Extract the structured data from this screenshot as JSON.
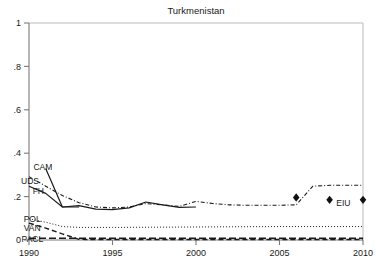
{
  "chart_data": {
    "type": "line",
    "title": "Turkmenistan",
    "xlabel": "",
    "ylabel": "",
    "xlim": [
      1990,
      2010
    ],
    "ylim": [
      0,
      1
    ],
    "grid": false,
    "legend_position": "inline-left",
    "xticks": [
      "1990",
      "1995",
      "2000",
      "2005",
      "2010"
    ],
    "xtick_values": [
      1990,
      1995,
      2000,
      2005,
      2010
    ],
    "yticks": [
      "0",
      ".2",
      ".4",
      ".6",
      ".8",
      "1"
    ],
    "ytick_values": [
      0,
      0.2,
      0.4,
      0.6,
      0.8,
      1
    ],
    "series": [
      {
        "name": "CAM",
        "label": "CAM",
        "style": "solid",
        "label_x": 1991.4,
        "label_y": 0.335,
        "x": [
          1991,
          1992,
          1993
        ],
        "values": [
          0.33,
          0.152,
          0.152
        ]
      },
      {
        "name": "UDS",
        "label": "UDS",
        "style": "dash-dot",
        "label_x": 1990.6,
        "label_y": 0.272,
        "x": [
          1990,
          1991,
          1992,
          1993,
          1994,
          1995,
          1996,
          1997,
          1998,
          1999,
          2000,
          2001,
          2002,
          2003,
          2004,
          2005,
          2006,
          2007,
          2008,
          2009,
          2010
        ],
        "values": [
          0.292,
          0.248,
          0.205,
          0.172,
          0.152,
          0.148,
          0.152,
          0.168,
          0.162,
          0.155,
          0.178,
          0.168,
          0.162,
          0.16,
          0.16,
          0.16,
          0.162,
          0.248,
          0.252,
          0.252,
          0.252
        ]
      },
      {
        "name": "FH",
        "label": "FH",
        "style": "solid",
        "label_x": 1990.9,
        "label_y": 0.228,
        "x": [
          1990,
          1991,
          1992,
          1993,
          1994,
          1995,
          1996,
          1997,
          1998,
          1999,
          2000
        ],
        "values": [
          0.248,
          0.215,
          0.152,
          0.158,
          0.142,
          0.14,
          0.148,
          0.175,
          0.162,
          0.15,
          0.152
        ]
      },
      {
        "name": "POL",
        "label": "POL",
        "style": "dotted",
        "label_x": 1990.7,
        "label_y": 0.095,
        "x": [
          1990,
          1991,
          1992,
          1993,
          1994,
          1995,
          2000,
          2005,
          2010
        ],
        "values": [
          0.098,
          0.082,
          0.062,
          0.058,
          0.058,
          0.058,
          0.06,
          0.062,
          0.062
        ]
      },
      {
        "name": "VAN",
        "label": "VAN",
        "style": "dashed",
        "label_x": 1990.7,
        "label_y": 0.055,
        "x": [
          1990,
          1991,
          1992,
          1993,
          1994,
          2000,
          2010
        ],
        "values": [
          0.078,
          0.055,
          0.028,
          0.003,
          0.002,
          0.002,
          0.002
        ]
      },
      {
        "name": "PACL",
        "label": "PACL",
        "style": "long-dash",
        "label_x": 1990.85,
        "label_y": 0.004,
        "x": [
          1990,
          1992,
          1994,
          1996,
          1998,
          2000,
          2005,
          2010
        ],
        "values": [
          0.008,
          0.008,
          0.008,
          0.008,
          0.008,
          0.008,
          0.008,
          0.008
        ]
      },
      {
        "name": "EIU",
        "label": "EIU",
        "style": "markers",
        "marker": "diamond",
        "label_x": 2008.4,
        "label_y": 0.172,
        "x": [
          2006,
          2008,
          2010
        ],
        "values": [
          0.196,
          0.185,
          0.185
        ]
      }
    ]
  }
}
